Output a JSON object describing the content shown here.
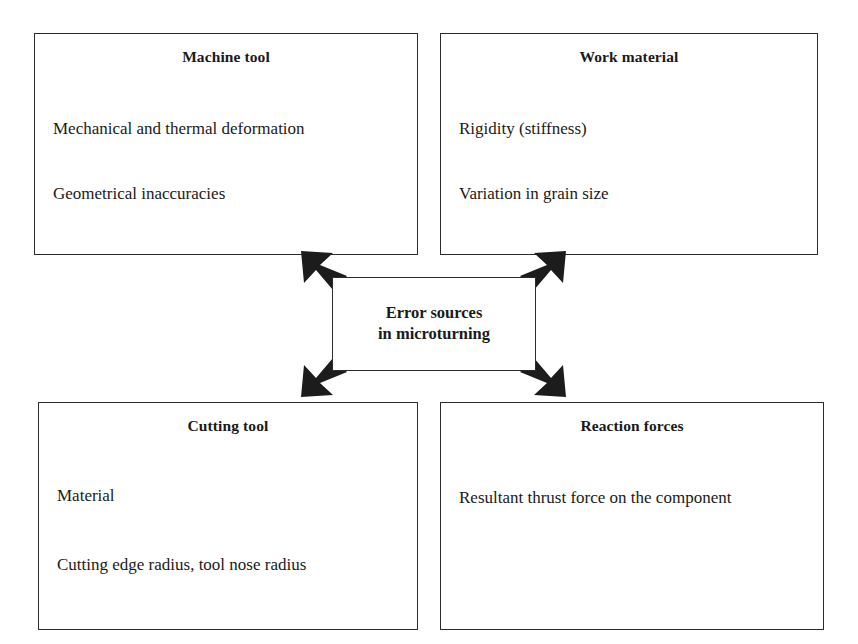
{
  "diagram": {
    "title_text": "Error sources in microturning",
    "center": {
      "name": "center-node",
      "line1": "Error sources",
      "line2": "in microturning"
    },
    "nodes": [
      {
        "id": "machine-tool",
        "title": "Machine tool",
        "items": [
          "Mechanical and thermal deformation",
          "Geometrical inaccuracies"
        ]
      },
      {
        "id": "work-material",
        "title": "Work material",
        "items": [
          "Rigidity (stiffness)",
          "Variation in grain size"
        ]
      },
      {
        "id": "cutting-tool",
        "title": "Cutting tool",
        "items": [
          "Material",
          "Cutting edge radius, tool nose radius"
        ]
      },
      {
        "id": "reaction-forces",
        "title": "Reaction forces",
        "items": [
          "Resultant thrust force on the component"
        ]
      }
    ],
    "connectors": [
      {
        "id": "arrow-center-to-machine-tool",
        "direction": "up-left",
        "from": "center-node",
        "to": "machine-tool"
      },
      {
        "id": "arrow-center-to-work-material",
        "direction": "up-right",
        "from": "center-node",
        "to": "work-material"
      },
      {
        "id": "arrow-center-to-cutting-tool",
        "direction": "down-left",
        "from": "center-node",
        "to": "cutting-tool"
      },
      {
        "id": "arrow-center-to-reaction-forces",
        "direction": "down-right",
        "from": "center-node",
        "to": "reaction-forces"
      }
    ],
    "colors": {
      "background": "#ffffff",
      "border": "#2b2b2b",
      "text": "#1a1a1a",
      "arrow": "#1c1c1c"
    }
  }
}
